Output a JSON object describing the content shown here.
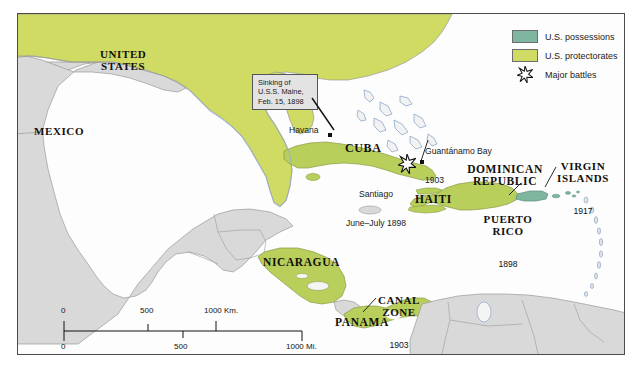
{
  "map": {
    "title": "U.S. Possessions and Protectorates in the Caribbean and Central America",
    "background_color": "#ffffff",
    "water_color": "#fdfdfd",
    "frame_color": "#4a4a4a",
    "possession_color": "#7fb6a0",
    "protectorate_color": "#cfdb63",
    "other_land_color": "#d6d6d6",
    "border_color": "#8d8d8d",
    "coast_color": "#7f9ec4"
  },
  "legend": {
    "items": [
      {
        "label": "U.S. possessions",
        "color": "#7fb6a0",
        "symbol": "swatch"
      },
      {
        "label": "U.S. protectorates",
        "color": "#cfdb63",
        "symbol": "swatch"
      },
      {
        "label": "Major battles",
        "color": "#ffffff",
        "symbol": "star-icon"
      }
    ]
  },
  "labels": {
    "united_states": "UNITED\nSTATES",
    "mexico": "MEXICO",
    "cuba": "CUBA",
    "havana": "Havana",
    "santiago": "Santiago",
    "santiago_date": "June–July 1898",
    "guantanamo": "Guantánamo Bay",
    "guantanamo_year": "1903",
    "dominican": "DOMINICAN\nREPUBLIC",
    "haiti": "HAITI",
    "puerto_rico": "PUERTO\nRICO",
    "puerto_rico_year": "1898",
    "virgin_islands": "VIRGIN\nISLANDS",
    "virgin_islands_year": "1917",
    "nicaragua": "NICARAGUA",
    "canal_zone": "CANAL\nZONE",
    "canal_zone_year": "1903",
    "panama": "PANAMA"
  },
  "callout": {
    "line1": "Sinking of",
    "line2": "U.S.S. Maine,",
    "line3": "Feb. 15, 1898"
  },
  "scale": {
    "km": {
      "ticks": [
        "0",
        "500",
        "1000 Km."
      ]
    },
    "mi": {
      "ticks": [
        "0",
        "500",
        "1000 Mi."
      ]
    }
  },
  "battles": [
    {
      "name": "Santiago",
      "year": "June–July 1898"
    }
  ]
}
